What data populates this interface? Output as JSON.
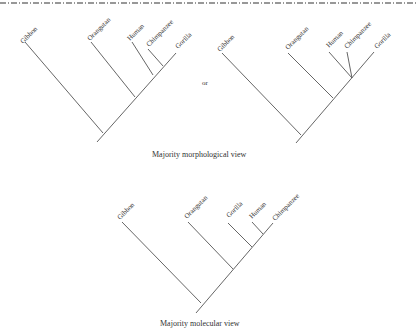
{
  "figure": {
    "separator": "dash-dot-line",
    "or_label": "or",
    "trees": [
      {
        "id": "morph-a",
        "caption": "",
        "taxa": [
          "Gibbon",
          "Orangutan",
          "Human",
          "Chimpanzee",
          "Gorilla"
        ],
        "topology": "(Gibbon,(Orangutan,((Human,Chimpanzee),Gorilla)))"
      },
      {
        "id": "morph-b",
        "caption": "",
        "taxa": [
          "Gibbon",
          "Orangutan",
          "Human",
          "Chimpanzee",
          "Gorilla"
        ],
        "topology": "(Gibbon,(Orangutan,(Human,Chimpanzee,Gorilla)))"
      },
      {
        "id": "molecular",
        "caption": "Majority molecular view",
        "taxa": [
          "Gibbon",
          "Orangutan",
          "Gorilla",
          "Human",
          "Chimpanzee"
        ],
        "topology": "(Gibbon,(Orangutan,(Gorilla,(Human,Chimpanzee))))"
      }
    ],
    "morphological_caption": "Majority morphological  view",
    "molecular_caption": "Majority molecular view"
  }
}
